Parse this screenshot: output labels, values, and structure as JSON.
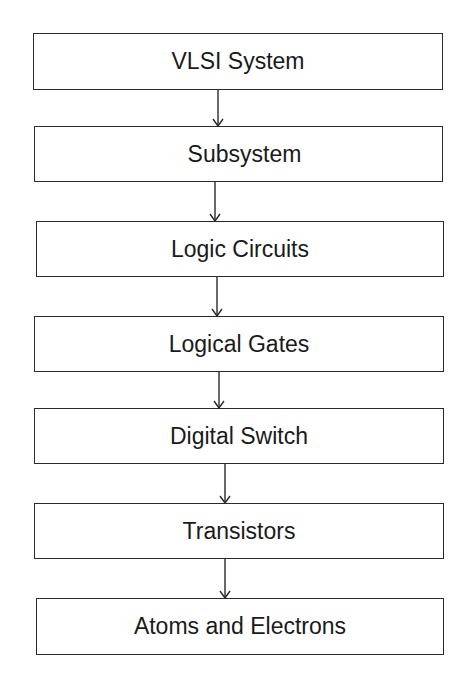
{
  "diagram": {
    "type": "vertical-flowchart",
    "nodes": [
      {
        "id": "vlsi-system",
        "label": "VLSI System"
      },
      {
        "id": "subsystem",
        "label": "Subsystem"
      },
      {
        "id": "logic-circuits",
        "label": "Logic Circuits"
      },
      {
        "id": "logical-gates",
        "label": "Logical Gates"
      },
      {
        "id": "digital-switch",
        "label": "Digital Switch"
      },
      {
        "id": "transistors",
        "label": "Transistors"
      },
      {
        "id": "atoms-and-electrons",
        "label": "Atoms and Electrons"
      }
    ],
    "edges": [
      {
        "from": "vlsi-system",
        "to": "subsystem"
      },
      {
        "from": "subsystem",
        "to": "logic-circuits"
      },
      {
        "from": "logic-circuits",
        "to": "logical-gates"
      },
      {
        "from": "logical-gates",
        "to": "digital-switch"
      },
      {
        "from": "digital-switch",
        "to": "transistors"
      },
      {
        "from": "transistors",
        "to": "atoms-and-electrons"
      }
    ],
    "colors": {
      "stroke": "#2a2a2a",
      "text": "#1a1a1a",
      "background": "#ffffff"
    }
  }
}
